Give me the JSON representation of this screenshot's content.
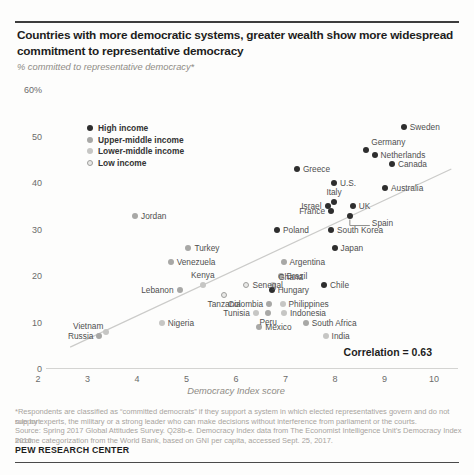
{
  "header": {
    "title": "Countries with more democratic systems, greater wealth show more widespread commitment to representative democracy",
    "subtitle": "% committed to representative democracy*"
  },
  "chart_data": {
    "type": "scatter",
    "title": "Countries with more democratic systems, greater wealth show more widespread commitment to representative democracy",
    "subtitle": "% committed to representative democracy*",
    "xlabel": "Democracy Index score",
    "ylabel": "% committed to representative democracy*",
    "xlim": [
      2,
      10
    ],
    "ylim": [
      0,
      60
    ],
    "grid": false,
    "legend_position": "top-left",
    "annotation": "Correlation = 0.63",
    "x_ticks": [
      2,
      3,
      4,
      5,
      6,
      7,
      8,
      9,
      10
    ],
    "y_ticks": [
      {
        "value": 60,
        "label": "60%"
      },
      {
        "value": 50,
        "label": "50"
      },
      {
        "value": 40,
        "label": "40"
      },
      {
        "value": 30,
        "label": "30"
      },
      {
        "value": 20,
        "label": "20"
      },
      {
        "value": 10,
        "label": "10"
      },
      {
        "value": 0,
        "label": "0"
      }
    ],
    "trendline": {
      "x1": 2.65,
      "y1": 4.7,
      "x2": 10.35,
      "y2": 43
    },
    "series": [
      {
        "name": "High income",
        "color": "#2e2e2e",
        "points": [
          {
            "country": "Sweden",
            "x": 9.39,
            "y": 52,
            "label_pos": "right"
          },
          {
            "country": "Germany",
            "x": 8.63,
            "y": 47,
            "label_pos": "above-right"
          },
          {
            "country": "Netherlands",
            "x": 8.8,
            "y": 46,
            "label_pos": "right"
          },
          {
            "country": "Canada",
            "x": 9.15,
            "y": 44,
            "label_pos": "right"
          },
          {
            "country": "Greece",
            "x": 7.23,
            "y": 43,
            "label_pos": "right"
          },
          {
            "country": "Australia",
            "x": 9.01,
            "y": 39,
            "label_pos": "right"
          },
          {
            "country": "U.S.",
            "x": 7.98,
            "y": 40,
            "label_pos": "right"
          },
          {
            "country": "Italy",
            "x": 7.98,
            "y": 36,
            "label_pos": "above"
          },
          {
            "country": "Israel",
            "x": 7.85,
            "y": 35,
            "label_pos": "left"
          },
          {
            "country": "UK",
            "x": 8.36,
            "y": 35,
            "label_pos": "right"
          },
          {
            "country": "France",
            "x": 7.92,
            "y": 34,
            "label_pos": "left"
          },
          {
            "country": "Spain",
            "x": 8.3,
            "y": 33,
            "label_pos": "callout"
          },
          {
            "country": "Poland",
            "x": 6.83,
            "y": 30,
            "label_pos": "right"
          },
          {
            "country": "South Korea",
            "x": 7.92,
            "y": 30,
            "label_pos": "right"
          },
          {
            "country": "Japan",
            "x": 7.99,
            "y": 26,
            "label_pos": "right"
          },
          {
            "country": "Chile",
            "x": 7.78,
            "y": 18,
            "label_pos": "right"
          },
          {
            "country": "Hungary",
            "x": 6.72,
            "y": 17,
            "label_pos": "right"
          }
        ]
      },
      {
        "name": "Upper-middle income",
        "color": "#a8a8a6",
        "points": [
          {
            "country": "Jordan",
            "x": 3.96,
            "y": 33,
            "label_pos": "right"
          },
          {
            "country": "Turkey",
            "x": 5.04,
            "y": 26,
            "label_pos": "right"
          },
          {
            "country": "Venezuela",
            "x": 4.68,
            "y": 23,
            "label_pos": "right"
          },
          {
            "country": "Lebanon",
            "x": 4.86,
            "y": 17,
            "label_pos": "left"
          },
          {
            "country": "Argentina",
            "x": 6.96,
            "y": 23,
            "label_pos": "right"
          },
          {
            "country": "Brazil",
            "x": 6.9,
            "y": 20,
            "label_pos": "right"
          },
          {
            "country": "Colombia",
            "x": 6.67,
            "y": 14,
            "label_pos": "left"
          },
          {
            "country": "Peru",
            "x": 6.65,
            "y": 12,
            "label_pos": "below"
          },
          {
            "country": "Mexico",
            "x": 6.47,
            "y": 9,
            "label_pos": "right"
          },
          {
            "country": "South Africa",
            "x": 7.41,
            "y": 10,
            "label_pos": "right"
          },
          {
            "country": "Russia",
            "x": 3.24,
            "y": 7,
            "label_pos": "left"
          }
        ]
      },
      {
        "name": "Lower-middle income",
        "color": "#c6c6c4",
        "points": [
          {
            "country": "Kenya",
            "x": 5.33,
            "y": 18,
            "label_pos": "above"
          },
          {
            "country": "Ghana",
            "x": 6.75,
            "y": 18,
            "label_pos": "above-right"
          },
          {
            "country": "Nigeria",
            "x": 4.5,
            "y": 10,
            "label_pos": "right"
          },
          {
            "country": "Tunisia",
            "x": 6.4,
            "y": 12,
            "label_pos": "left"
          },
          {
            "country": "Indonesia",
            "x": 6.97,
            "y": 12,
            "label_pos": "right"
          },
          {
            "country": "Philippines",
            "x": 6.94,
            "y": 14,
            "label_pos": "right"
          },
          {
            "country": "Vietnam",
            "x": 3.38,
            "y": 8,
            "label_pos": "above-left"
          },
          {
            "country": "India",
            "x": 7.81,
            "y": 7,
            "label_pos": "right"
          }
        ]
      },
      {
        "name": "Low income",
        "color": "#e9e9e7",
        "border": "#9e9e9c",
        "points": [
          {
            "country": "Senegal",
            "x": 6.21,
            "y": 18,
            "label_pos": "right"
          },
          {
            "country": "Tanzania",
            "x": 5.76,
            "y": 16,
            "label_pos": "below"
          }
        ]
      }
    ]
  },
  "footer": {
    "note_lines": [
      "*Respondents are classified as “committed democrats” if they support a system in which elected representatives govern and do not support",
      "rule by experts, the military or a strong leader who can make decisions without interference from parliament or the courts.",
      "Source: Spring 2017 Global Attitudes Survey. Q28b-e. Democracy Index data from The Economist Intelligence Unit’s Democracy Index 2016.",
      "Income categorization from the World Bank, based on GNI per capita, accessed Sept. 25, 2017."
    ],
    "org": "PEW RESEARCH CENTER"
  }
}
